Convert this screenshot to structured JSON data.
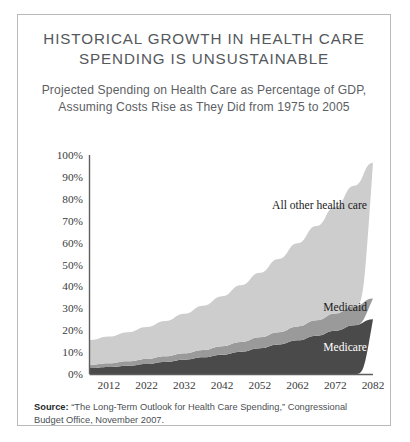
{
  "figure": {
    "title": "HISTORICAL GROWTH IN HEALTH CARE SPENDING IS UNSUSTAINABLE",
    "subtitle": "Projected Spending on Health Care as Percentage of GDP, Assuming Costs Rise as They Did from 1975 to 2005",
    "source_label": "Source:",
    "source_text": " “The Long-Term Outlook for Health Care Spending,” Congressional Budget Office, November 2007."
  },
  "colors": {
    "medicare": "#4a4a4a",
    "medicaid": "#9a9a9a",
    "all_other": "#cdcdcd",
    "axis": "#5e5e5e",
    "border": "#b9b9b9",
    "title_text": "#54585c"
  },
  "chart_data": {
    "type": "area",
    "stacked": true,
    "title": "Projected Spending on Health Care as Percentage of GDP, Assuming Costs Rise as They Did from 1975 to 2005",
    "xlabel": "",
    "ylabel": "",
    "xlim": [
      2007,
      2082
    ],
    "ylim": [
      0,
      100
    ],
    "grid": false,
    "legend_position": "inline-right",
    "x_ticks": [
      2012,
      2022,
      2032,
      2042,
      2052,
      2062,
      2072,
      2082
    ],
    "x_tick_labels": [
      "2012",
      "2022",
      "2032",
      "2042",
      "2052",
      "2062",
      "2072",
      "2082"
    ],
    "y_ticks": [
      0,
      10,
      20,
      30,
      40,
      50,
      60,
      70,
      80,
      90,
      100
    ],
    "y_tick_labels": [
      "0%",
      "10%",
      "20%",
      "30%",
      "40%",
      "50%",
      "60%",
      "70%",
      "80%",
      "90%",
      "100%"
    ],
    "x": [
      2007,
      2012,
      2017,
      2022,
      2027,
      2032,
      2037,
      2042,
      2047,
      2052,
      2057,
      2062,
      2067,
      2072,
      2077,
      2082
    ],
    "series": [
      {
        "name": "Medicare",
        "color": "#4a4a4a",
        "values": [
          2.7,
          3.2,
          3.8,
          4.6,
          5.5,
          6.5,
          7.6,
          8.8,
          10.2,
          11.8,
          13.5,
          15.4,
          17.5,
          19.8,
          22.3,
          25.0
        ]
      },
      {
        "name": "Medicaid",
        "color": "#9a9a9a",
        "values": [
          1.5,
          1.7,
          2.0,
          2.3,
          2.6,
          3.0,
          3.4,
          3.9,
          4.4,
          5.0,
          5.6,
          6.3,
          7.0,
          7.8,
          8.6,
          9.5
        ]
      },
      {
        "name": "All other health care",
        "color": "#cdcdcd",
        "values": [
          11.3,
          12.2,
          13.3,
          14.6,
          16.1,
          18.0,
          20.2,
          22.8,
          25.9,
          29.4,
          33.4,
          38.0,
          43.1,
          48.8,
          55.1,
          62.0
        ]
      }
    ],
    "totals": [
      15.5,
      17.1,
      19.1,
      21.5,
      24.2,
      27.5,
      31.2,
      35.5,
      40.5,
      46.2,
      52.5,
      59.7,
      67.6,
      76.4,
      86.0,
      96.5
    ],
    "annotations": [
      {
        "text": "All other health care",
        "series": "All other health care"
      },
      {
        "text": "Medicaid",
        "series": "Medicaid"
      },
      {
        "text": "Medicare",
        "series": "Medicare"
      }
    ]
  }
}
